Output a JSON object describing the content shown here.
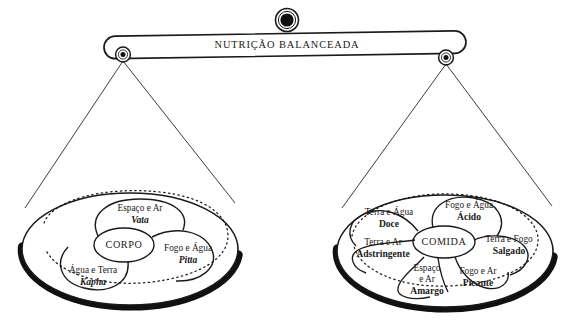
{
  "diagram": {
    "title": "NUTRIÇÃO BALANCEADA",
    "type": "balance-scale",
    "language": "pt-BR",
    "colors": {
      "ink": "#1a1a1a",
      "pan_shadow": "#111111",
      "background": "#ffffff"
    }
  },
  "beam": {
    "label": "NUTRIÇÃO BALANCEADA"
  },
  "left_pan": {
    "center_label": "CORPO",
    "lobes": [
      {
        "elements": "Espaço e Ar",
        "name": "Vata"
      },
      {
        "elements": "Fogo e Água",
        "name": "Pitta"
      },
      {
        "elements": "Água e Terra",
        "name": "Kapha"
      }
    ]
  },
  "right_pan": {
    "center_label": "COMIDA",
    "lobes": [
      {
        "elements": "Terra e Água",
        "name": "Doce"
      },
      {
        "elements": "Fogo e Água",
        "name": "Ácido"
      },
      {
        "elements": "Terra e Fogo",
        "name": "Salgado"
      },
      {
        "elements": "Fogo e Ar",
        "name": "Picante"
      },
      {
        "elements_line1": "Espaço",
        "elements_line2": "e Ar",
        "name": "Amargo"
      },
      {
        "elements": "Terra e Ar",
        "name": "Adstringente"
      }
    ]
  }
}
